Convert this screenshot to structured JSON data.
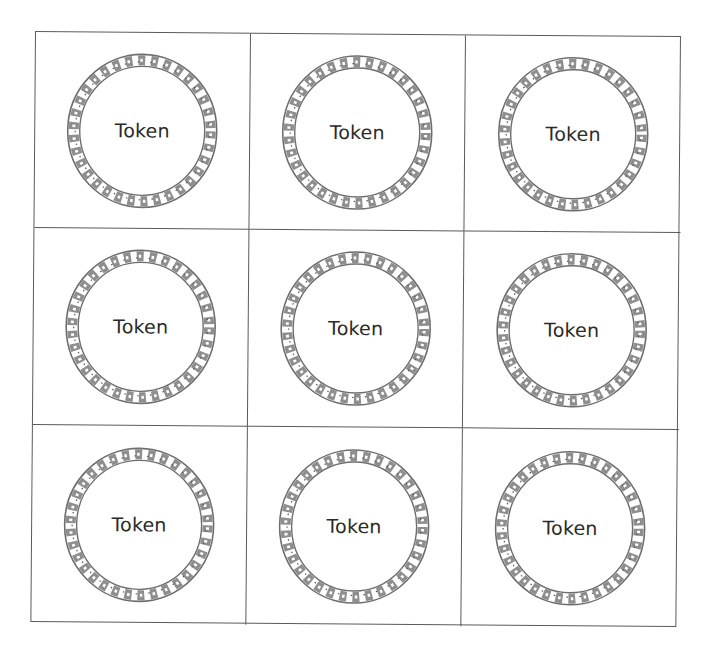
{
  "sheet": {
    "layout": "3x3 grid of circular tokens",
    "line_color": "#5a5a5a",
    "ring_color": "#6e6e6e",
    "text_color": "#2a2a2a"
  },
  "tokens": [
    {
      "label": "Token",
      "icon": "decorative-wave-ring-icon"
    },
    {
      "label": "Token",
      "icon": "decorative-wave-ring-icon"
    },
    {
      "label": "Token",
      "icon": "decorative-wave-ring-icon"
    },
    {
      "label": "Token",
      "icon": "decorative-wave-ring-icon"
    },
    {
      "label": "Token",
      "icon": "decorative-wave-ring-icon"
    },
    {
      "label": "Token",
      "icon": "decorative-wave-ring-icon"
    },
    {
      "label": "Token",
      "icon": "decorative-wave-ring-icon"
    },
    {
      "label": "Token",
      "icon": "decorative-wave-ring-icon"
    },
    {
      "label": "Token",
      "icon": "decorative-wave-ring-icon"
    }
  ]
}
